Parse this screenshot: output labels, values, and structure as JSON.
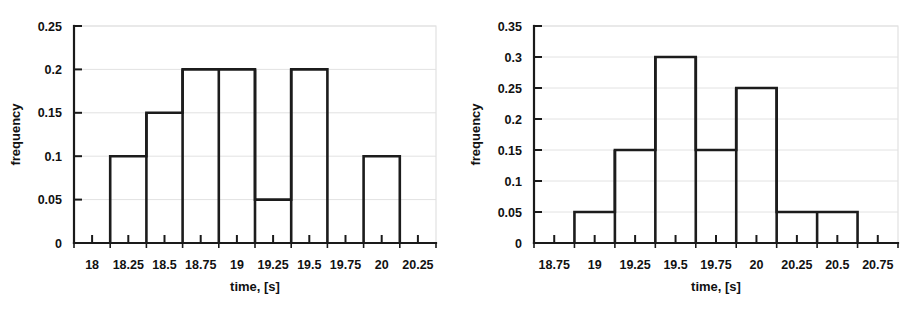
{
  "page": {
    "background": "#ffffff",
    "ink_color": "#1a1a1a",
    "grid_color": "#e2e2e2"
  },
  "chart_data": [
    {
      "id": "left-histogram",
      "type": "bar",
      "title": "",
      "xlabel": "time, [s]",
      "ylabel": "frequency",
      "grid": true,
      "legend": "none",
      "xlim": [
        17.875,
        20.375
      ],
      "ylim": [
        0,
        0.25
      ],
      "xticks": [
        18,
        18.25,
        18.5,
        18.75,
        19,
        19.25,
        19.5,
        19.75,
        20,
        20.25
      ],
      "xticklabels": [
        "18",
        "18.25",
        "18.5",
        "18.75",
        "19",
        "19.25",
        "19.5",
        "19.75",
        "20",
        "20.25"
      ],
      "yticks": [
        0,
        0.05,
        0.1,
        0.15,
        0.2,
        0.25
      ],
      "yticklabels": [
        "0",
        "0.05",
        "0.1",
        "0.15",
        "0.2",
        "0.25"
      ],
      "xminor_step": 0.125,
      "bin_width": 0.25,
      "bins": [
        {
          "left": 18.125,
          "right": 18.375,
          "value": 0.1
        },
        {
          "left": 18.375,
          "right": 18.625,
          "value": 0.15
        },
        {
          "left": 18.625,
          "right": 18.875,
          "value": 0.2
        },
        {
          "left": 18.875,
          "right": 19.125,
          "value": 0.2
        },
        {
          "left": 19.125,
          "right": 19.375,
          "value": 0.05
        },
        {
          "left": 19.375,
          "right": 19.625,
          "value": 0.2
        },
        {
          "left": 19.875,
          "right": 20.125,
          "value": 0.1
        }
      ],
      "categories": [
        "18.125-18.375",
        "18.375-18.625",
        "18.625-18.875",
        "18.875-19.125",
        "19.125-19.375",
        "19.375-19.625",
        "19.875-20.125"
      ],
      "values": [
        0.1,
        0.15,
        0.2,
        0.2,
        0.05,
        0.2,
        0.1
      ]
    },
    {
      "id": "right-histogram",
      "type": "bar",
      "title": "",
      "xlabel": "time, [s]",
      "ylabel": "frequency",
      "grid": true,
      "legend": "none",
      "xlim": [
        18.625,
        20.875
      ],
      "ylim": [
        0,
        0.35
      ],
      "xticks": [
        18.75,
        19,
        19.25,
        19.5,
        19.75,
        20,
        20.25,
        20.5,
        20.75
      ],
      "xticklabels": [
        "18.75",
        "19",
        "19.25",
        "19.5",
        "19.75",
        "20",
        "20.25",
        "20.5",
        "20.75"
      ],
      "yticks": [
        0,
        0.05,
        0.1,
        0.15,
        0.2,
        0.25,
        0.3,
        0.35
      ],
      "yticklabels": [
        "0",
        "0.05",
        "0.1",
        "0.15",
        "0.2",
        "0.25",
        "0.3",
        "0.35"
      ],
      "xminor_step": 0.125,
      "bin_width": 0.25,
      "bins": [
        {
          "left": 18.875,
          "right": 19.125,
          "value": 0.05
        },
        {
          "left": 19.125,
          "right": 19.375,
          "value": 0.15
        },
        {
          "left": 19.375,
          "right": 19.625,
          "value": 0.3
        },
        {
          "left": 19.625,
          "right": 19.875,
          "value": 0.15
        },
        {
          "left": 19.875,
          "right": 20.125,
          "value": 0.25
        },
        {
          "left": 20.125,
          "right": 20.375,
          "value": 0.05
        },
        {
          "left": 20.375,
          "right": 20.625,
          "value": 0.05
        }
      ],
      "categories": [
        "18.875-19.125",
        "19.125-19.375",
        "19.375-19.625",
        "19.625-19.875",
        "19.875-20.125",
        "20.125-20.375",
        "20.375-20.625"
      ],
      "values": [
        0.05,
        0.15,
        0.3,
        0.15,
        0.25,
        0.05,
        0.05
      ]
    }
  ]
}
